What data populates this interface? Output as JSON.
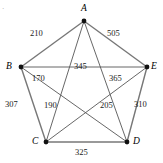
{
  "figure": {
    "background_color": "#ffffff",
    "edge_color": "#565656",
    "vertex_color": "#111111",
    "corner_mark": "·"
  },
  "vertices": [
    {
      "id": "A",
      "label": "A",
      "x": 84,
      "y": 21,
      "label_x": 81,
      "label_y": 4
    },
    {
      "id": "B",
      "label": "B",
      "x": 21,
      "y": 67,
      "label_x": 6,
      "label_y": 62
    },
    {
      "id": "C",
      "label": "C",
      "x": 46,
      "y": 142,
      "label_x": 32,
      "label_y": 137
    },
    {
      "id": "D",
      "label": "D",
      "x": 127,
      "y": 142,
      "label_x": 133,
      "label_y": 137
    },
    {
      "id": "E",
      "label": "E",
      "x": 147,
      "y": 67,
      "label_x": 151,
      "label_y": 62
    }
  ],
  "edges": [
    {
      "from": "A",
      "to": "B",
      "weight": "210",
      "label_x": 30,
      "label_y": 29,
      "outer": true
    },
    {
      "from": "A",
      "to": "E",
      "weight": "505",
      "label_x": 107,
      "label_y": 29,
      "outer": true
    },
    {
      "from": "B",
      "to": "E",
      "weight": "345",
      "label_x": 74,
      "label_y": 62,
      "outer": false
    },
    {
      "from": "B",
      "to": "D",
      "weight": "170",
      "label_x": 32,
      "label_y": 74,
      "outer": false
    },
    {
      "from": "A",
      "to": "D",
      "weight": "365",
      "label_x": 109,
      "label_y": 74,
      "outer": false
    },
    {
      "from": "B",
      "to": "C",
      "weight": "307",
      "label_x": 5,
      "label_y": 100,
      "outer": true
    },
    {
      "from": "A",
      "to": "C",
      "weight": "190",
      "label_x": 44,
      "label_y": 101,
      "outer": false
    },
    {
      "from": "C",
      "to": "E",
      "weight": "205",
      "label_x": 100,
      "label_y": 101,
      "outer": false
    },
    {
      "from": "D",
      "to": "E",
      "weight": "310",
      "label_x": 134,
      "label_y": 100,
      "outer": true
    },
    {
      "from": "C",
      "to": "D",
      "weight": "325",
      "label_x": 75,
      "label_y": 148,
      "outer": true
    }
  ],
  "chart_data": {
    "type": "diagram",
    "subtype": "weighted-complete-graph-K5",
    "nodes": [
      "A",
      "B",
      "C",
      "D",
      "E"
    ],
    "edge_weights": {
      "A-B": 210,
      "A-C": 190,
      "A-D": 365,
      "A-E": 505,
      "B-C": 307,
      "B-D": 170,
      "B-E": 345,
      "C-D": 325,
      "C-E": 205,
      "D-E": 310
    },
    "title": "",
    "xlabel": "",
    "ylabel": ""
  }
}
